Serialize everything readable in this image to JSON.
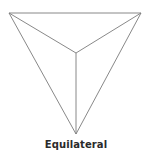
{
  "diagram": {
    "caption": "Equilateral",
    "stroke_color": "#7a7a7a",
    "vertices": {
      "top_left": [
        9,
        13
      ],
      "top_right": [
        141,
        13
      ],
      "bottom": [
        76,
        134
      ],
      "center": [
        76,
        53
      ]
    }
  }
}
